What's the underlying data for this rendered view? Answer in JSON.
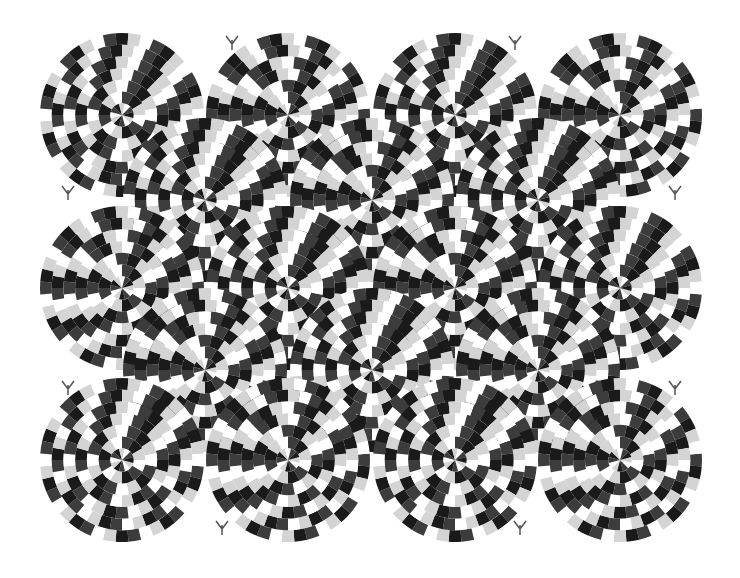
{
  "title": "Rotating snakes optical illusion",
  "canvas": {
    "width": 740,
    "height": 578,
    "background": "#ffffff"
  },
  "palette": {
    "black": "#1a1a1a",
    "dark_gray": "#3c3c3c",
    "white": "#ffffff",
    "light_gray": "#d4d4d4"
  },
  "circles": [
    {
      "cx": 122,
      "cy": 115,
      "r": 82
    },
    {
      "cx": 288,
      "cy": 115,
      "r": 82
    },
    {
      "cx": 455,
      "cy": 115,
      "r": 82
    },
    {
      "cx": 620,
      "cy": 115,
      "r": 82
    },
    {
      "cx": 205,
      "cy": 200,
      "r": 82
    },
    {
      "cx": 372,
      "cy": 200,
      "r": 82
    },
    {
      "cx": 538,
      "cy": 200,
      "r": 82
    },
    {
      "cx": 122,
      "cy": 288,
      "r": 82
    },
    {
      "cx": 288,
      "cy": 288,
      "r": 82
    },
    {
      "cx": 455,
      "cy": 288,
      "r": 82
    },
    {
      "cx": 620,
      "cy": 288,
      "r": 82
    },
    {
      "cx": 205,
      "cy": 370,
      "r": 82
    },
    {
      "cx": 372,
      "cy": 370,
      "r": 82
    },
    {
      "cx": 538,
      "cy": 370,
      "r": 82
    },
    {
      "cx": 122,
      "cy": 460,
      "r": 82
    },
    {
      "cx": 288,
      "cy": 460,
      "r": 82
    },
    {
      "cx": 455,
      "cy": 460,
      "r": 82
    },
    {
      "cx": 620,
      "cy": 460,
      "r": 82
    }
  ],
  "rings": 7,
  "segments_per_ring": 40,
  "snake_heads": [
    {
      "x": 232,
      "y": 40
    },
    {
      "x": 515,
      "y": 40
    },
    {
      "x": 68,
      "y": 190
    },
    {
      "x": 675,
      "y": 190
    },
    {
      "x": 68,
      "y": 385
    },
    {
      "x": 675,
      "y": 385
    },
    {
      "x": 222,
      "y": 525
    },
    {
      "x": 520,
      "y": 525
    }
  ]
}
